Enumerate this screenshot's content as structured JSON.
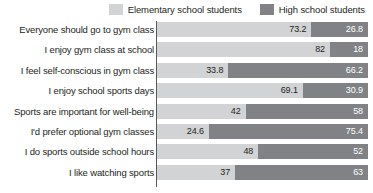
{
  "legend": {
    "items": [
      {
        "label": "Elementary school students",
        "color": "#d2d3d4",
        "icon": "legend-swatch-icon"
      },
      {
        "label": "High school students",
        "color": "#808285",
        "icon": "legend-swatch-icon"
      }
    ]
  },
  "chart_data": {
    "type": "bar",
    "orientation": "horizontal",
    "stacked": true,
    "stacked_percent": true,
    "title": "",
    "subtitle": "",
    "xlabel": "",
    "ylabel": "",
    "xlim": [
      0,
      100
    ],
    "grid": false,
    "legend_position": "top-right",
    "categories": [
      "Everyone should go to gym class",
      "I enjoy gym class at school",
      "I feel self-conscious in gym class",
      "I enjoy school sports days",
      "Sports are important for well-being",
      "I'd prefer optional gym classes",
      "I do sports outside school hours",
      "I like watching sports"
    ],
    "series": [
      {
        "name": "Elementary school students",
        "color": "#d2d3d4",
        "values": [
          73.2,
          82,
          33.8,
          69.1,
          42,
          24.6,
          48,
          37
        ],
        "labels": [
          "73.2",
          "82",
          "33.8",
          "69.1",
          "42",
          "24.6",
          "48",
          "37"
        ]
      },
      {
        "name": "High school students",
        "color": "#808285",
        "values": [
          26.8,
          18,
          66.2,
          30.9,
          58,
          75.4,
          52,
          63
        ],
        "labels": [
          "26.8",
          "18",
          "66.2",
          "30.9",
          "58",
          "75.4",
          "52",
          "63"
        ]
      }
    ]
  }
}
